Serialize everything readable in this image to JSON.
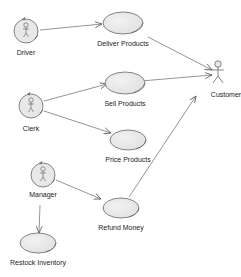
{
  "diagram": {
    "type": "use-case",
    "actors": [
      {
        "id": "driver",
        "label": "Driver",
        "style": "business-worker"
      },
      {
        "id": "clerk",
        "label": "Clerk",
        "style": "business-worker"
      },
      {
        "id": "manager",
        "label": "Manager",
        "style": "business-worker"
      },
      {
        "id": "customer",
        "label": "Customer",
        "style": "stick-figure"
      }
    ],
    "use_cases": [
      {
        "id": "deliver",
        "label": "Deliver Products"
      },
      {
        "id": "sell",
        "label": "Sell Products"
      },
      {
        "id": "price",
        "label": "Price Products"
      },
      {
        "id": "refund",
        "label": "Refund Money"
      },
      {
        "id": "restock",
        "label": "Restock Inventory"
      }
    ],
    "associations": [
      {
        "from": "driver",
        "to": "deliver"
      },
      {
        "from": "deliver",
        "to": "customer"
      },
      {
        "from": "sell",
        "to": "customer"
      },
      {
        "from": "clerk",
        "to": "sell"
      },
      {
        "from": "clerk",
        "to": "price"
      },
      {
        "from": "manager",
        "to": "refund"
      },
      {
        "from": "refund",
        "to": "customer"
      },
      {
        "from": "manager",
        "to": "restock"
      }
    ],
    "colors": {
      "usecase_fill": "#e8e8e8",
      "stroke": "#555555",
      "line": "#666666"
    }
  }
}
